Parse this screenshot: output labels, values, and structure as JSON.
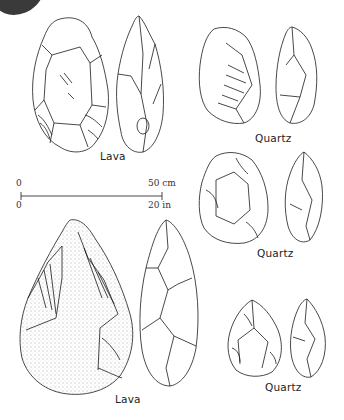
{
  "figure": {
    "top_fragment": {
      "icon": "stone-photo-fragment"
    },
    "labels": {
      "top_left": "Lava",
      "top_right": "Quartz",
      "middle_right": "Quartz",
      "bottom_left": "Lava",
      "bottom_right": "Quartz"
    },
    "scale_bar": {
      "start_top": "0",
      "start_bottom": "0",
      "end_top": "50 cm",
      "end_bottom": "20 in"
    },
    "specimens": [
      {
        "id": "lava-1",
        "material": "Lava",
        "views": [
          "face",
          "profile"
        ]
      },
      {
        "id": "quartz-1",
        "material": "Quartz",
        "views": [
          "face",
          "profile"
        ]
      },
      {
        "id": "quartz-2",
        "material": "Quartz",
        "views": [
          "face",
          "profile"
        ]
      },
      {
        "id": "lava-2",
        "material": "Lava",
        "views": [
          "face",
          "profile"
        ]
      },
      {
        "id": "quartz-3",
        "material": "Quartz",
        "views": [
          "face",
          "profile"
        ]
      }
    ],
    "colors": {
      "ink": "#1a1a1a",
      "background": "#ffffff",
      "photo_fragment": "#3a3a3a"
    }
  }
}
